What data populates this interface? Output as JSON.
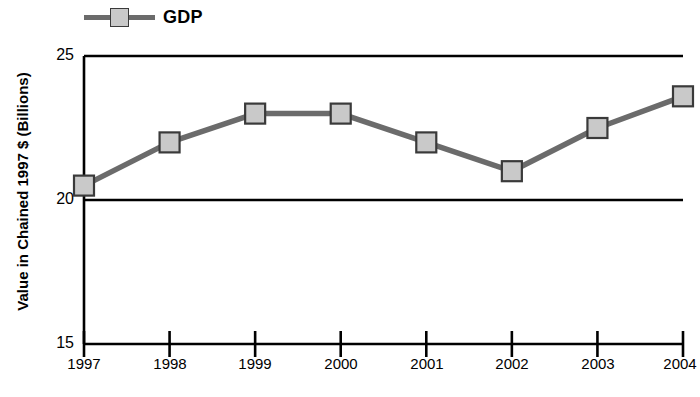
{
  "legend": {
    "label": "GDP",
    "line_color": "#6b6b6b",
    "marker_fill": "#c9c9c9",
    "marker_stroke": "#3a3a3a"
  },
  "axes": {
    "ylabel": "Value in Chained 1997 $ (Billions)",
    "xlabel": "",
    "yticks": [
      "25",
      "20",
      "15"
    ],
    "xticks": [
      "1997",
      "1998",
      "1999",
      "2000",
      "2001",
      "2002",
      "2003",
      "2004"
    ]
  },
  "chart_data": {
    "type": "line",
    "title": "",
    "xlabel": "",
    "ylabel": "Value in Chained 1997 $ (Billions)",
    "categories": [
      "1997",
      "1998",
      "1999",
      "2000",
      "2001",
      "2002",
      "2003",
      "2004"
    ],
    "x": [
      1997,
      1998,
      1999,
      2000,
      2001,
      2002,
      2003,
      2004
    ],
    "series": [
      {
        "name": "GDP",
        "values": [
          20.5,
          22.0,
          23.0,
          23.0,
          22.0,
          21.0,
          22.5,
          23.6
        ]
      }
    ],
    "ylim": [
      15,
      25
    ],
    "ytick_values": [
      15,
      20,
      25
    ],
    "xlim": [
      1997,
      2004
    ],
    "grid": "horizontal-at-20-and-25",
    "legend_position": "top-left",
    "marker": "square",
    "line_color": "#6b6b6b",
    "marker_fill": "#c9c9c9"
  }
}
